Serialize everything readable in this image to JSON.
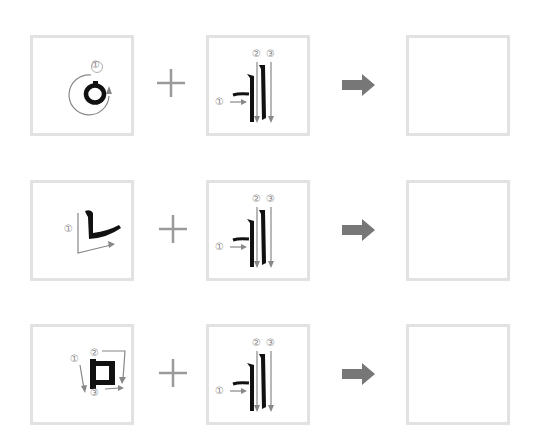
{
  "colors": {
    "box_border": "#e2e2e2",
    "stroke_black": "#111111",
    "guide_gray": "#888888",
    "plus_gray": "#9a9a9a",
    "arrow_gray": "#777777"
  },
  "rows": [
    {
      "consonant": {
        "glyph": "ㅇ",
        "stroke_numbers": [
          "①"
        ]
      },
      "operator": "+",
      "vowel": {
        "glyph": "ㅒ",
        "stroke_numbers": [
          "①",
          "②",
          "③"
        ]
      },
      "result": ""
    },
    {
      "consonant": {
        "glyph": "ㄴ",
        "stroke_numbers": [
          "①"
        ]
      },
      "operator": "+",
      "vowel": {
        "glyph": "ㅒ",
        "stroke_numbers": [
          "①",
          "②",
          "③"
        ]
      },
      "result": ""
    },
    {
      "consonant": {
        "glyph": "ㅁ",
        "stroke_numbers": [
          "①",
          "②",
          "③"
        ]
      },
      "operator": "+",
      "vowel": {
        "glyph": "ㅒ",
        "stroke_numbers": [
          "①",
          "②",
          "③"
        ]
      },
      "result": ""
    }
  ]
}
